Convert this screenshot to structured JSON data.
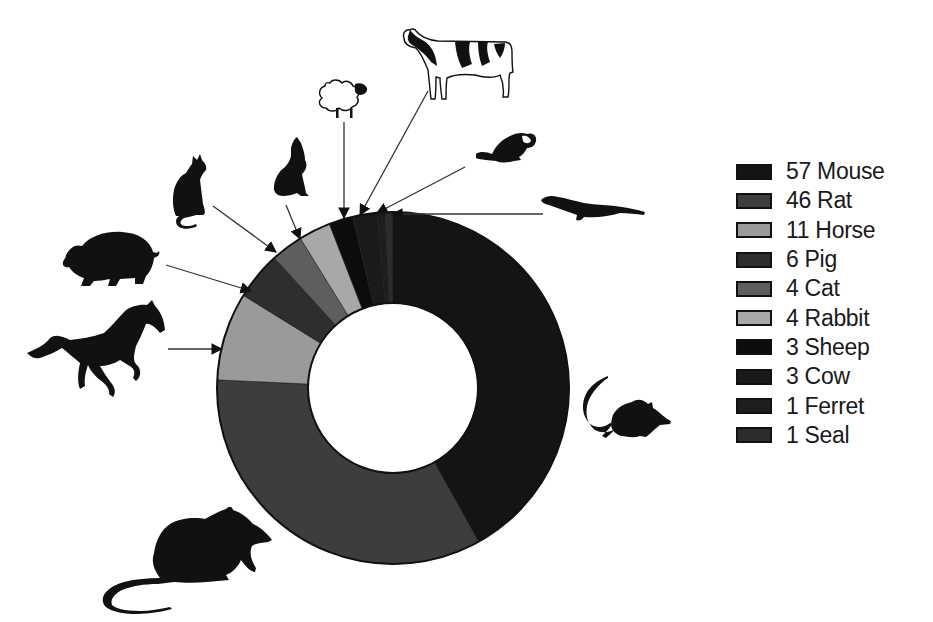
{
  "chart_data": {
    "type": "pie",
    "variant": "donut",
    "title": "",
    "start_angle_deg": -90,
    "direction": "clockwise",
    "categories": [
      "Mouse",
      "Rat",
      "Horse",
      "Pig",
      "Cat",
      "Rabbit",
      "Sheep",
      "Cow",
      "Ferret",
      "Seal"
    ],
    "values": [
      57,
      46,
      11,
      6,
      4,
      4,
      3,
      3,
      1,
      1
    ],
    "colors": [
      "#141414",
      "#3d3d3d",
      "#9a9a9a",
      "#2e2e2e",
      "#5e5e5e",
      "#a8a8a8",
      "#0c0c0c",
      "#1a1a1a",
      "#1e1e1e",
      "#2c2c2c"
    ],
    "legend_position": "right",
    "legend_entries": [
      "57 Mouse",
      "46 Rat",
      "11 Horse",
      "6 Pig",
      "4 Cat",
      "4 Rabbit",
      "3 Sheep",
      "3 Cow",
      "1 Ferret",
      "1 Seal"
    ],
    "center": [
      393,
      388
    ],
    "outer_radius": 176,
    "inner_radius": 85
  },
  "legend": [
    {
      "label": "57 Mouse",
      "color": "#141414"
    },
    {
      "label": "46 Rat",
      "color": "#3d3d3d"
    },
    {
      "label": "11 Horse",
      "color": "#9a9a9a"
    },
    {
      "label": "6 Pig",
      "color": "#2e2e2e"
    },
    {
      "label": "4 Cat",
      "color": "#5e5e5e"
    },
    {
      "label": "4 Rabbit",
      "color": "#a8a8a8"
    },
    {
      "label": "3 Sheep",
      "color": "#0c0c0c"
    },
    {
      "label": "3 Cow",
      "color": "#1a1a1a"
    },
    {
      "label": "1 Ferret",
      "color": "#1e1e1e"
    },
    {
      "label": "1 Seal",
      "color": "#2c2c2c"
    }
  ],
  "icons": [
    {
      "name": "mouse-icon"
    },
    {
      "name": "rat-icon"
    },
    {
      "name": "horse-icon"
    },
    {
      "name": "pig-icon"
    },
    {
      "name": "cat-icon"
    },
    {
      "name": "rabbit-icon"
    },
    {
      "name": "sheep-icon"
    },
    {
      "name": "cow-icon"
    },
    {
      "name": "ferret-icon"
    },
    {
      "name": "seal-icon"
    }
  ]
}
